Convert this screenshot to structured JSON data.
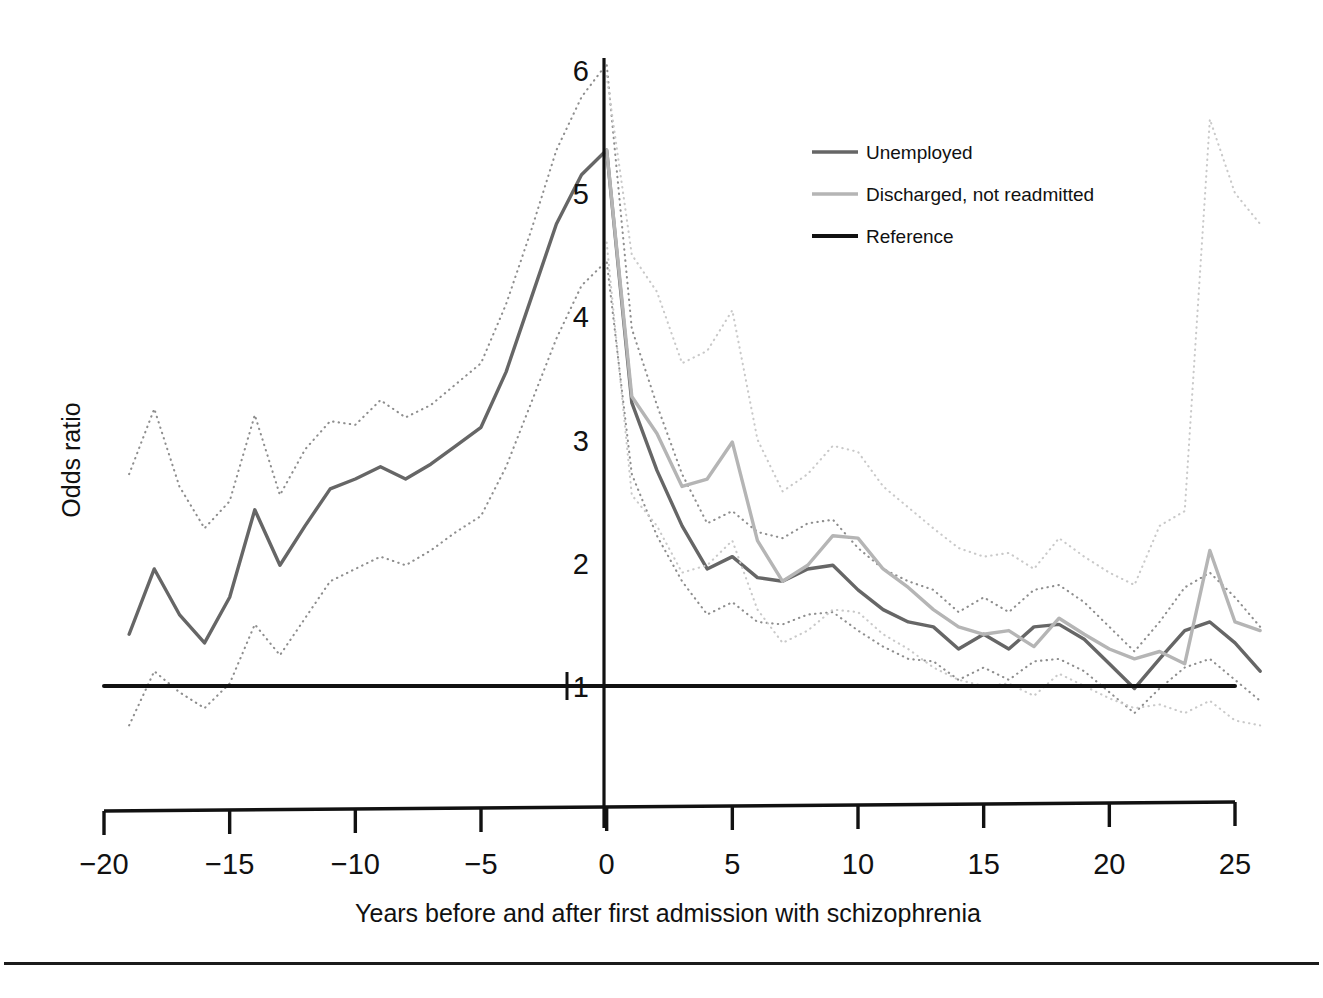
{
  "chart_data": {
    "type": "line",
    "title": "",
    "xlabel": "Years before and after first admission with schizophrenia",
    "ylabel": "Odds ratio",
    "xlim": [
      -20,
      26
    ],
    "ylim": [
      0.45,
      6.3
    ],
    "xticks": [
      -20,
      -15,
      -10,
      -5,
      0,
      5,
      10,
      15,
      20,
      25
    ],
    "xticklabels": [
      "−20",
      "−15",
      "−10",
      "−5",
      "0",
      "5",
      "10",
      "15",
      "20",
      "25"
    ],
    "yticks": [
      1,
      2,
      3,
      4,
      5,
      6
    ],
    "yticklabels": [
      "1",
      "2",
      "3",
      "4",
      "5",
      "6"
    ],
    "grid": false,
    "legend_position": "top-right",
    "colors": {
      "unemployed": "#666666",
      "discharged": "#b5b5b5",
      "reference": "#111111",
      "ci_unemployed": "#8e8e8e",
      "ci_discharged": "#c9c9c9",
      "axis": "#111111",
      "background": "#ffffff"
    },
    "series": [
      {
        "name": "Unemployed",
        "style": "solid",
        "color": "#666666",
        "x": [
          -19,
          -18,
          -17,
          -16,
          -15,
          -14,
          -13,
          -12,
          -11,
          -10,
          -9,
          -8,
          -7,
          -6,
          -5,
          -4,
          -3,
          -2,
          -1,
          0,
          1,
          2,
          3,
          4,
          5,
          6,
          7,
          8,
          9,
          10,
          11,
          12,
          13,
          14,
          15,
          16,
          17,
          18,
          19,
          20,
          21,
          22,
          23,
          24,
          25,
          26
        ],
        "values": [
          1.42,
          1.95,
          1.58,
          1.35,
          1.72,
          2.43,
          1.98,
          2.3,
          2.6,
          2.68,
          2.78,
          2.68,
          2.8,
          2.95,
          3.1,
          3.55,
          4.15,
          4.75,
          5.15,
          5.35,
          3.3,
          2.75,
          2.3,
          1.95,
          2.05,
          1.88,
          1.85,
          1.95,
          1.98,
          1.78,
          1.62,
          1.52,
          1.48,
          1.3,
          1.42,
          1.3,
          1.48,
          1.5,
          1.38,
          1.18,
          0.98,
          1.22,
          1.45,
          1.52,
          1.35,
          1.12
        ]
      },
      {
        "name": "Unemployed CI upper",
        "style": "dotted",
        "color": "#8e8e8e",
        "x": [
          -19,
          -18,
          -17,
          -16,
          -15,
          -14,
          -13,
          -12,
          -11,
          -10,
          -9,
          -8,
          -7,
          -6,
          -5,
          -4,
          -3,
          -2,
          -1,
          0,
          1,
          2,
          3,
          4,
          5,
          6,
          7,
          8,
          9,
          10,
          11,
          12,
          13,
          14,
          15,
          16,
          17,
          18,
          19,
          20,
          21,
          22,
          23,
          24,
          25,
          26
        ],
        "values": [
          2.72,
          3.25,
          2.62,
          2.28,
          2.5,
          3.2,
          2.55,
          2.92,
          3.15,
          3.12,
          3.32,
          3.18,
          3.28,
          3.45,
          3.62,
          4.1,
          4.7,
          5.35,
          5.78,
          6.05,
          3.9,
          3.28,
          2.72,
          2.32,
          2.42,
          2.25,
          2.2,
          2.32,
          2.35,
          2.12,
          1.95,
          1.85,
          1.78,
          1.6,
          1.72,
          1.6,
          1.78,
          1.82,
          1.68,
          1.48,
          1.28,
          1.52,
          1.8,
          1.92,
          1.72,
          1.48
        ]
      },
      {
        "name": "Unemployed CI lower",
        "style": "dotted",
        "color": "#8e8e8e",
        "x": [
          -19,
          -18,
          -17,
          -16,
          -15,
          -14,
          -13,
          -12,
          -11,
          -10,
          -9,
          -8,
          -7,
          -6,
          -5,
          -4,
          -3,
          -2,
          -1,
          0,
          1,
          2,
          3,
          4,
          5,
          6,
          7,
          8,
          9,
          10,
          11,
          12,
          13,
          14,
          15,
          16,
          17,
          18,
          19,
          20,
          21,
          22,
          23,
          24,
          25,
          26
        ],
        "values": [
          0.68,
          1.12,
          0.95,
          0.82,
          1.02,
          1.5,
          1.25,
          1.55,
          1.85,
          1.95,
          2.05,
          1.98,
          2.1,
          2.25,
          2.38,
          2.78,
          3.3,
          3.82,
          4.25,
          4.45,
          2.72,
          2.22,
          1.85,
          1.58,
          1.68,
          1.52,
          1.5,
          1.58,
          1.6,
          1.45,
          1.32,
          1.22,
          1.2,
          1.05,
          1.15,
          1.05,
          1.2,
          1.22,
          1.12,
          0.95,
          0.78,
          0.98,
          1.15,
          1.22,
          1.05,
          0.88
        ]
      },
      {
        "name": "Discharged, not readmitted",
        "style": "solid",
        "color": "#b5b5b5",
        "x": [
          0,
          1,
          2,
          3,
          4,
          5,
          6,
          7,
          8,
          9,
          10,
          11,
          12,
          13,
          14,
          15,
          16,
          17,
          18,
          19,
          20,
          21,
          22,
          23,
          24,
          25,
          26
        ],
        "values": [
          5.35,
          3.35,
          3.05,
          2.62,
          2.68,
          2.98,
          2.18,
          1.85,
          1.98,
          2.22,
          2.2,
          1.95,
          1.8,
          1.62,
          1.48,
          1.42,
          1.45,
          1.32,
          1.55,
          1.42,
          1.3,
          1.22,
          1.28,
          1.18,
          2.1,
          1.52,
          1.45
        ]
      },
      {
        "name": "Discharged CI upper",
        "style": "dotted",
        "color": "#c9c9c9",
        "x": [
          0,
          1,
          2,
          3,
          4,
          5,
          6,
          7,
          8,
          9,
          10,
          11,
          12,
          13,
          14,
          15,
          16,
          17,
          18,
          19,
          20,
          21,
          22,
          23,
          24,
          25,
          26
        ],
        "values": [
          5.95,
          4.5,
          4.2,
          3.62,
          3.72,
          4.05,
          3.0,
          2.58,
          2.72,
          2.95,
          2.9,
          2.62,
          2.45,
          2.28,
          2.12,
          2.05,
          2.08,
          1.95,
          2.2,
          2.05,
          1.92,
          1.82,
          2.3,
          2.42,
          5.6,
          5.0,
          4.75
        ]
      },
      {
        "name": "Discharged CI lower",
        "style": "dotted",
        "color": "#c9c9c9",
        "x": [
          0,
          1,
          2,
          3,
          4,
          5,
          6,
          7,
          8,
          9,
          10,
          11,
          12,
          13,
          14,
          15,
          16,
          17,
          18,
          19,
          20,
          21,
          22,
          23,
          24,
          25,
          26
        ],
        "values": [
          4.6,
          2.55,
          2.3,
          1.92,
          1.98,
          2.18,
          1.62,
          1.35,
          1.45,
          1.62,
          1.6,
          1.42,
          1.3,
          1.15,
          1.05,
          1.0,
          1.02,
          0.92,
          1.1,
          1.0,
          0.9,
          0.82,
          0.85,
          0.78,
          0.88,
          0.72,
          0.68
        ]
      },
      {
        "name": "Reference",
        "style": "solid",
        "color": "#111111",
        "x": [
          -20,
          25
        ],
        "values": [
          1,
          1
        ]
      }
    ],
    "legend": [
      {
        "label": "Unemployed",
        "color": "#666666",
        "style": "solid"
      },
      {
        "label": "Discharged, not readmitted",
        "color": "#b5b5b5",
        "style": "solid"
      },
      {
        "label": "Reference",
        "color": "#111111",
        "style": "solid"
      }
    ],
    "annotations": {
      "vertical_line_at_x": 0
    }
  },
  "caption": {
    "rule": true,
    "text": ""
  }
}
